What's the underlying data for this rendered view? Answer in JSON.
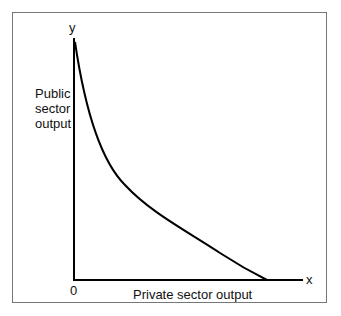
{
  "diagram": {
    "type": "production possibility curve",
    "y_axis_letter": "y",
    "x_axis_letter": "x",
    "origin_label": "0",
    "y_axis_label_lines": [
      "Public",
      "sector",
      "output"
    ],
    "x_axis_label": "Private sector output",
    "curve": "convex downward-sloping curve from top of y-axis to x-axis"
  }
}
